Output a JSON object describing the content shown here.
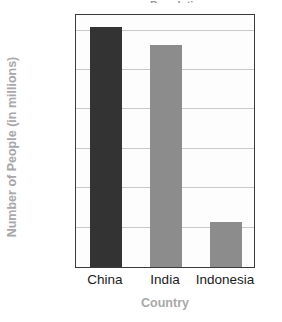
{
  "figure": {
    "cropped_title_fragment": "Population",
    "background_color": "#ffffff"
  },
  "chart_data": {
    "type": "bar",
    "title": "",
    "categories": [
      "China",
      "India",
      "Indonesia"
    ],
    "values": [
      1220,
      1130,
      230
    ],
    "series": [
      {
        "name": "Number of People (in millions)",
        "values": [
          1220,
          1130,
          230
        ]
      }
    ],
    "bar_colors": [
      "#333333",
      "#8c8c8c",
      "#8c8c8c"
    ],
    "xlabel": "Country",
    "ylabel": "Number of People (in millions)",
    "ylim": [
      0,
      1290
    ],
    "yticks": [
      0,
      200,
      400,
      600,
      800,
      1000,
      1200
    ],
    "ytick_labels": [
      "0",
      "200",
      "400",
      "600",
      "800",
      "1,000",
      "1,200"
    ],
    "grid": true,
    "grid_color": "#c9c9c9",
    "legend": "none",
    "axis_label_color": "#a8a8a8",
    "tick_label_color": "#1a1a1a",
    "frame_color": "#3a3a3a",
    "plot_background": "#fdfdfd"
  }
}
